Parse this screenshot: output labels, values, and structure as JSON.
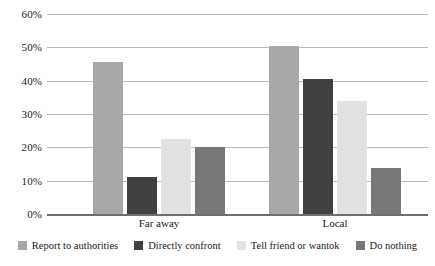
{
  "chart_data": {
    "type": "bar",
    "title": "",
    "subtitle": "",
    "xlabel": "",
    "ylabel": "",
    "categories": [
      "Far away",
      "Local"
    ],
    "ylim": [
      0,
      60
    ],
    "ytick_labels": [
      "60%",
      "50%",
      "40%",
      "30%",
      "20%",
      "10%",
      "0%"
    ],
    "ytick_values": [
      60,
      50,
      40,
      30,
      20,
      10,
      0
    ],
    "ytick_step": 10,
    "grid": true,
    "legend_position": "bottom",
    "series": [
      {
        "name": "Report to authorities",
        "color": "#a8a8a8",
        "values": [
          45.5,
          50.5
        ]
      },
      {
        "name": "Directly confront",
        "color": "#404040",
        "values": [
          11.0,
          40.5
        ]
      },
      {
        "name": "Tell friend or wantok",
        "color": "#e2e2e2",
        "values": [
          22.5,
          34.0
        ]
      },
      {
        "name": "Do nothing",
        "color": "#787878",
        "values": [
          20.0,
          13.7
        ]
      }
    ]
  },
  "colors": {
    "gridline": "#b9b9b9",
    "baseline": "#6e6e6e",
    "background": "#ffffff",
    "text": "#1a1a1a"
  }
}
